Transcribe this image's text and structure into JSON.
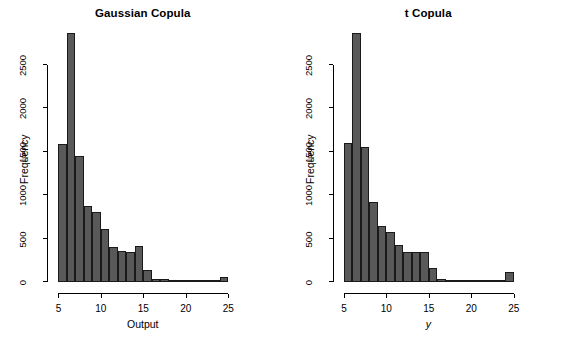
{
  "figure": {
    "background": "#ffffff",
    "bar_fill": "#595959",
    "bar_border": "#1a1a1a",
    "axis_color": "#000000"
  },
  "chart_data": [
    {
      "type": "bar",
      "subtype": "histogram",
      "title": "Gaussian Copula",
      "xlabel": "Output",
      "ylabel": "Frequency",
      "xlim": [
        4.6,
        25.2
      ],
      "ylim": [
        0,
        2900
      ],
      "xticks": [
        5,
        10,
        15,
        20,
        25
      ],
      "xtick_labels": [
        "5",
        "10",
        "15",
        "20",
        "25"
      ],
      "yticks": [
        0,
        500,
        1000,
        1500,
        2000,
        2500
      ],
      "ytick_labels": [
        "0",
        "500",
        "1000",
        "1500",
        "2000",
        "2500"
      ],
      "grid": false,
      "legend": null,
      "bin_width": 1,
      "bin_edges": [
        5,
        6,
        7,
        8,
        9,
        10,
        11,
        12,
        13,
        14,
        15,
        16,
        17,
        18,
        19,
        20,
        21,
        22,
        23,
        24,
        25
      ],
      "bin_centers": [
        5.5,
        6.5,
        7.5,
        8.5,
        9.5,
        10.5,
        11.5,
        12.5,
        13.5,
        14.5,
        15.5,
        16.5,
        17.5,
        18.5,
        19.5,
        20.5,
        21.5,
        22.5,
        23.5,
        24.5
      ],
      "values": [
        1590,
        2860,
        1450,
        870,
        800,
        610,
        400,
        360,
        345,
        415,
        135,
        35,
        30,
        12,
        10,
        10,
        10,
        12,
        15,
        60
      ]
    },
    {
      "type": "bar",
      "subtype": "histogram",
      "title": "t Copula",
      "xlabel": "y",
      "xlabel_style": "italic",
      "ylabel": "Frequency",
      "xlim": [
        4.6,
        25.2
      ],
      "ylim": [
        0,
        2900
      ],
      "xticks": [
        5,
        10,
        15,
        20,
        25
      ],
      "xtick_labels": [
        "5",
        "10",
        "15",
        "20",
        "25"
      ],
      "yticks": [
        0,
        500,
        1000,
        1500,
        2000,
        2500
      ],
      "ytick_labels": [
        "0",
        "500",
        "1000",
        "1500",
        "2000",
        "2500"
      ],
      "grid": false,
      "legend": null,
      "bin_width": 1,
      "bin_edges": [
        5,
        6,
        7,
        8,
        9,
        10,
        11,
        12,
        13,
        14,
        15,
        16,
        17,
        18,
        19,
        20,
        21,
        22,
        23,
        24,
        25
      ],
      "bin_centers": [
        5.5,
        6.5,
        7.5,
        8.5,
        9.5,
        10.5,
        11.5,
        12.5,
        13.5,
        14.5,
        15.5,
        16.5,
        17.5,
        18.5,
        19.5,
        20.5,
        21.5,
        22.5,
        23.5,
        24.5
      ],
      "values": [
        1600,
        2860,
        1555,
        920,
        640,
        575,
        430,
        340,
        340,
        340,
        165,
        40,
        22,
        18,
        18,
        20,
        25,
        22,
        22,
        110
      ]
    }
  ]
}
